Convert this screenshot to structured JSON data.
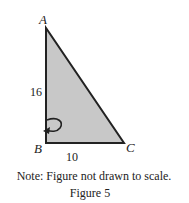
{
  "figure": {
    "vertices": {
      "A": {
        "label": "A",
        "x": 46,
        "y": 28
      },
      "B": {
        "label": "B",
        "x": 46,
        "y": 143
      },
      "C": {
        "label": "C",
        "x": 124,
        "y": 143
      }
    },
    "side_labels": {
      "AB": "16",
      "BC": "10"
    },
    "fill_color": "#c8c8c8",
    "stroke_color": "#222222",
    "note": "Note: Figure not drawn to scale.",
    "caption": "Figure 5",
    "rotation_marker": "rotation-arrow-icon"
  }
}
